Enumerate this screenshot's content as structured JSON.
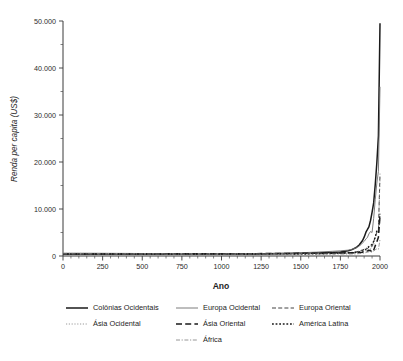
{
  "chart_data": {
    "type": "line",
    "title": "",
    "xlabel": "Ano",
    "ylabel": "Renda per capita (US$)",
    "xlim": [
      0,
      2000
    ],
    "ylim": [
      0,
      50000
    ],
    "xticks": [
      0,
      250,
      500,
      750,
      1000,
      1250,
      1500,
      1750,
      2000
    ],
    "xtick_labels": [
      "0",
      "250",
      "500",
      "750",
      "1000",
      "1250",
      "1500",
      "1750",
      "2000"
    ],
    "xtick_minor_step": 50,
    "yticks": [
      0,
      10000,
      20000,
      30000,
      40000,
      50000
    ],
    "ytick_labels": [
      "0",
      "10.000",
      "20.000",
      "30.000",
      "40.000",
      "50.000"
    ],
    "ytick_minor_step": 5000,
    "grid": false,
    "legend_position": "below",
    "legend_columns": 3,
    "series": [
      {
        "name": "Colônias Ocidentais",
        "style": "solid",
        "color": "#1a1a1a",
        "width": 1.5,
        "dash": "",
        "x": [
          1,
          200,
          400,
          600,
          800,
          1000,
          1100,
          1200,
          1300,
          1400,
          1500,
          1600,
          1700,
          1750,
          1800,
          1820,
          1850,
          1870,
          1890,
          1900,
          1913,
          1920,
          1930,
          1940,
          1950,
          1960,
          1970,
          1980,
          1990,
          2000
        ],
        "y": [
          400,
          400,
          400,
          400,
          400,
          400,
          420,
          450,
          480,
          520,
          560,
          620,
          750,
          850,
          1100,
          1300,
          1800,
          2400,
          3300,
          4000,
          5200,
          5600,
          6200,
          7500,
          9300,
          11300,
          15200,
          19800,
          25600,
          49500
        ]
      },
      {
        "name": "Europa Ocidental",
        "style": "solid-thin",
        "color": "#6e6e6e",
        "width": 0.9,
        "dash": "",
        "x": [
          1,
          200,
          400,
          600,
          800,
          1000,
          1100,
          1200,
          1300,
          1400,
          1500,
          1600,
          1700,
          1750,
          1800,
          1820,
          1850,
          1870,
          1890,
          1900,
          1913,
          1920,
          1930,
          1940,
          1950,
          1960,
          1970,
          1980,
          1990,
          2000
        ],
        "y": [
          600,
          580,
          550,
          500,
          450,
          420,
          450,
          500,
          550,
          580,
          700,
          820,
          1000,
          1100,
          1250,
          1400,
          1750,
          2100,
          2800,
          3100,
          3700,
          3900,
          4700,
          5200,
          5000,
          8000,
          12000,
          15500,
          18000,
          36000
        ]
      },
      {
        "name": "Europa Oriental",
        "style": "dashed",
        "color": "#2d2d2d",
        "width": 0.9,
        "dash": "4,2.2",
        "x": [
          1,
          200,
          400,
          600,
          800,
          1000,
          1100,
          1200,
          1300,
          1400,
          1500,
          1600,
          1700,
          1750,
          1800,
          1820,
          1850,
          1870,
          1890,
          1900,
          1913,
          1920,
          1930,
          1940,
          1950,
          1960,
          1970,
          1980,
          1990,
          2000
        ],
        "y": [
          400,
          400,
          400,
          400,
          400,
          400,
          410,
          430,
          450,
          470,
          500,
          550,
          600,
          650,
          700,
          750,
          900,
          1050,
          1300,
          1450,
          1700,
          1500,
          1900,
          2100,
          2100,
          3000,
          4200,
          5000,
          5400,
          17500
        ]
      },
      {
        "name": "Ásia Ocidental",
        "style": "dotted-fine",
        "color": "#8f8f8f",
        "width": 0.9,
        "dash": "1.2,1.6",
        "x": [
          1,
          200,
          400,
          600,
          800,
          1000,
          1100,
          1200,
          1300,
          1400,
          1500,
          1600,
          1700,
          1750,
          1800,
          1820,
          1850,
          1870,
          1890,
          1900,
          1913,
          1920,
          1930,
          1940,
          1950,
          1960,
          1970,
          1980,
          1990,
          2000
        ],
        "y": [
          550,
          540,
          520,
          500,
          480,
          470,
          470,
          480,
          490,
          500,
          520,
          550,
          570,
          590,
          620,
          640,
          700,
          780,
          900,
          1000,
          1200,
          1250,
          1400,
          1600,
          1800,
          2400,
          3800,
          5200,
          5300,
          16800
        ]
      },
      {
        "name": "Ásia Oriental",
        "style": "long-dashed",
        "color": "#1a1a1a",
        "width": 1.5,
        "dash": "6,3.2",
        "x": [
          1,
          200,
          400,
          600,
          800,
          1000,
          1100,
          1200,
          1300,
          1400,
          1500,
          1600,
          1700,
          1750,
          1800,
          1820,
          1850,
          1870,
          1890,
          1900,
          1913,
          1920,
          1930,
          1940,
          1950,
          1960,
          1970,
          1980,
          1990,
          2000
        ],
        "y": [
          450,
          450,
          450,
          450,
          460,
          470,
          480,
          500,
          520,
          540,
          570,
          590,
          600,
          620,
          640,
          660,
          680,
          720,
          800,
          880,
          1000,
          1050,
          1150,
          1200,
          750,
          1200,
          2200,
          3000,
          4000,
          8500
        ]
      },
      {
        "name": "América Latina",
        "style": "dotted",
        "color": "#1a1a1a",
        "width": 1.3,
        "dash": "1.8,1.8",
        "x": [
          1,
          200,
          400,
          600,
          800,
          1000,
          1100,
          1200,
          1300,
          1400,
          1500,
          1600,
          1700,
          1750,
          1800,
          1820,
          1850,
          1870,
          1890,
          1900,
          1913,
          1920,
          1930,
          1940,
          1950,
          1960,
          1970,
          1980,
          1990,
          2000
        ],
        "y": [
          400,
          400,
          400,
          400,
          400,
          400,
          410,
          420,
          430,
          440,
          420,
          440,
          520,
          560,
          690,
          700,
          760,
          900,
          1100,
          1250,
          1500,
          1700,
          2000,
          2200,
          2500,
          3100,
          4000,
          5400,
          5100,
          9000
        ]
      },
      {
        "name": "África",
        "style": "dash-dot",
        "color": "#8a8a8a",
        "width": 0.9,
        "dash": "4,1.6,1.2,1.6",
        "x": [
          1,
          200,
          400,
          600,
          800,
          1000,
          1100,
          1200,
          1300,
          1400,
          1500,
          1600,
          1700,
          1750,
          1800,
          1820,
          1850,
          1870,
          1890,
          1900,
          1913,
          1920,
          1930,
          1940,
          1950,
          1960,
          1970,
          1980,
          1990,
          2000
        ],
        "y": [
          450,
          440,
          430,
          420,
          420,
          410,
          420,
          430,
          430,
          430,
          420,
          420,
          420,
          420,
          420,
          420,
          450,
          500,
          580,
          640,
          740,
          800,
          900,
          1000,
          890,
          1060,
          1340,
          1520,
          1420,
          3500
        ]
      }
    ]
  },
  "axes": {
    "y_title": "Renda per capita (US$)",
    "x_title": "Ano"
  },
  "legend": {
    "entries": [
      {
        "label": "Colônias Ocidentais",
        "row": 0,
        "col": 0
      },
      {
        "label": "Europa Ocidental",
        "row": 0,
        "col": 1
      },
      {
        "label": "Europa Oriental",
        "row": 0,
        "col": 2
      },
      {
        "label": "Ásia Ocidental",
        "row": 1,
        "col": 0
      },
      {
        "label": "Ásia Oriental",
        "row": 1,
        "col": 1
      },
      {
        "label": "América Latina",
        "row": 1,
        "col": 2
      },
      {
        "label": "África",
        "row": 2,
        "col": 1
      }
    ]
  },
  "colors": {
    "background": "#ffffff",
    "axis": "#3a3a3a",
    "text": "#1d1d1d"
  }
}
